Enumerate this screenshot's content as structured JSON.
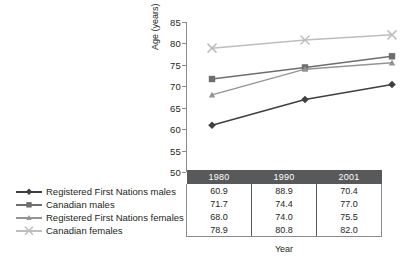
{
  "chart_data": {
    "type": "line",
    "title": "",
    "xlabel": "Year",
    "ylabel": "Age (years)",
    "categories": [
      "1980",
      "1990",
      "2001"
    ],
    "x": [
      1980,
      1990,
      2001
    ],
    "ylim": [
      50,
      85
    ],
    "yticks": [
      50,
      55,
      60,
      65,
      70,
      75,
      80,
      85
    ],
    "grid": false,
    "legend_position": "left-bottom",
    "series": [
      {
        "name": "Registered First Nations males",
        "values": [
          60.9,
          66.9,
          70.4
        ],
        "table_values": [
          "60.9",
          "88.9",
          "70.4"
        ],
        "marker": "diamond",
        "color": "#3f3f3f"
      },
      {
        "name": "Canadian males",
        "values": [
          71.7,
          74.4,
          77.0
        ],
        "table_values": [
          "71.7",
          "74.4",
          "77.0"
        ],
        "marker": "square",
        "color": "#6e6e6e"
      },
      {
        "name": "Registered First Nations females",
        "values": [
          68.0,
          74.0,
          75.5
        ],
        "table_values": [
          "68.0",
          "74.0",
          "75.5"
        ],
        "marker": "triangle",
        "color": "#949494"
      },
      {
        "name": "Canadian females",
        "values": [
          78.9,
          80.8,
          82.0
        ],
        "table_values": [
          "78.9",
          "80.8",
          "82.0"
        ],
        "marker": "x",
        "color": "#bdbdbd"
      }
    ]
  },
  "table": {
    "header": [
      "1980",
      "1990",
      "2001"
    ],
    "rows": [
      [
        "60.9",
        "88.9",
        "70.4"
      ],
      [
        "71.7",
        "74.4",
        "77.0"
      ],
      [
        "68.0",
        "74.0",
        "75.5"
      ],
      [
        "78.9",
        "80.8",
        "82.0"
      ]
    ]
  },
  "axis": {
    "y_label": "Age (years)",
    "x_label": "Year",
    "y_ticks": [
      "85",
      "80",
      "75",
      "70",
      "65",
      "60",
      "55",
      "50"
    ]
  },
  "colors": {
    "header_bar": "#58595b",
    "axis": "#8b8b8b",
    "text": "#231f20"
  }
}
